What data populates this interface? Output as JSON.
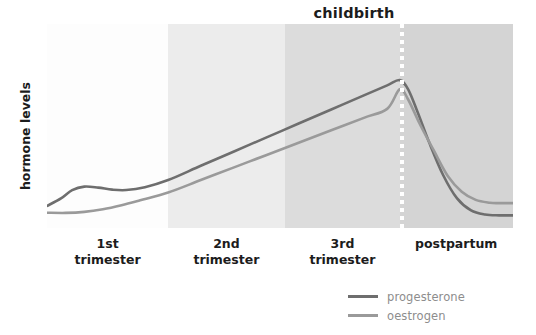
{
  "chart_data": {
    "type": "line",
    "title": "",
    "xlabel": "",
    "ylabel": "hormone levels",
    "grid": false,
    "legend_position": "bottom-right",
    "xlim": [
      0,
      100
    ],
    "ylim": [
      0,
      100
    ],
    "x_tick_labels": [
      "1st\ntrimester",
      "2nd\ntrimester",
      "3rd\ntrimester",
      "postpartum"
    ],
    "annotations": [
      {
        "label": "childbirth",
        "x": 75.7,
        "type": "vertical-dotted-line",
        "color": "#ffffff"
      }
    ],
    "bands": [
      {
        "label": "1st trimester",
        "x_start": 0.0,
        "x_end": 26.0,
        "color": "#fdfdfd"
      },
      {
        "label": "2nd trimester",
        "x_start": 26.0,
        "x_end": 51.1,
        "color": "#ececec"
      },
      {
        "label": "3rd trimester",
        "x_start": 51.1,
        "x_end": 75.7,
        "color": "#dcdcdc"
      },
      {
        "label": "postpartum",
        "x_start": 75.7,
        "x_end": 100.0,
        "color": "#d4d4d4"
      }
    ],
    "series": [
      {
        "name": "progesterone",
        "color": "#6e6e6e",
        "x": [
          0,
          3,
          5.4,
          8,
          11,
          14,
          17,
          21,
          26,
          33,
          40,
          47,
          54,
          61,
          68,
          73,
          75.7,
          77.5,
          79.5,
          82,
          85,
          88,
          91,
          94,
          97,
          100
        ],
        "y": [
          10.8,
          14.5,
          18.6,
          20.3,
          19.8,
          18.8,
          18.6,
          20.0,
          23.5,
          30.5,
          37.4,
          44.3,
          51.2,
          58.1,
          65.0,
          69.9,
          72.5,
          68.0,
          57.0,
          42.0,
          26.0,
          14.5,
          8.6,
          6.6,
          6.2,
          6.2
        ]
      },
      {
        "name": "oestrogen",
        "color": "#9a9a9a",
        "x": [
          0,
          4,
          8,
          12,
          16,
          20,
          26,
          33,
          40,
          47,
          54,
          61,
          68,
          73,
          75.7,
          77.5,
          80,
          83,
          86,
          89,
          92,
          95,
          97,
          100
        ],
        "y": [
          7.5,
          7.4,
          7.9,
          9.2,
          11.2,
          13.6,
          17.4,
          23.5,
          29.6,
          35.7,
          41.8,
          47.9,
          54.0,
          58.4,
          68.0,
          63.0,
          51.0,
          38.0,
          25.5,
          17.8,
          13.8,
          12.4,
          12.2,
          12.2
        ]
      }
    ]
  },
  "y_axis": {
    "label": "hormone levels"
  },
  "x_axis": {
    "labels": [
      {
        "text": "1st\ntrimester",
        "center_pct": 13.0
      },
      {
        "text": "2nd\ntrimester",
        "center_pct": 38.5
      },
      {
        "text": "3rd\ntrimester",
        "center_pct": 63.4
      },
      {
        "text": "postpartum",
        "center_pct": 87.8
      }
    ]
  },
  "annotation": {
    "childbirth_label": "childbirth"
  },
  "legend": {
    "items": [
      {
        "label": "progesterone",
        "color": "#6e6e6e"
      },
      {
        "label": "oestrogen",
        "color": "#9a9a9a"
      }
    ]
  }
}
